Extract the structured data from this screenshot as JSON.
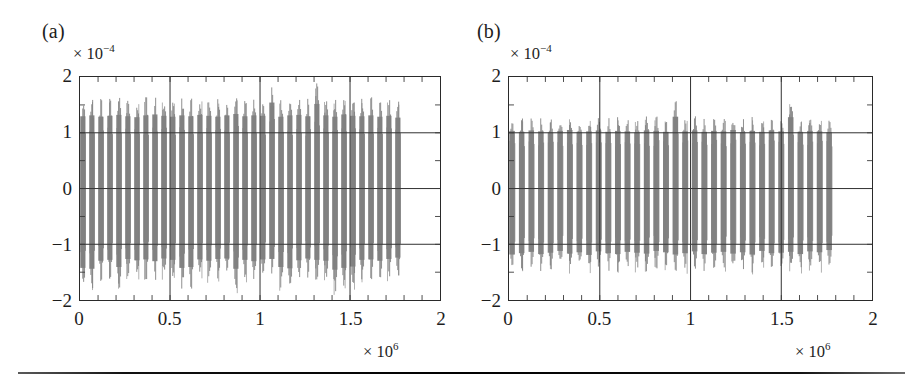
{
  "figure": {
    "background": "#ffffff",
    "trace_color": "#808080",
    "axis_color": "#2a2a2a",
    "has_bottom_rule": true
  },
  "panels": [
    {
      "key": "a",
      "label": "(a)",
      "y_multiplier_prefix": "× 10",
      "y_multiplier_exponent": "−4",
      "x_multiplier_prefix": "× 10",
      "x_multiplier_exponent": "6",
      "y_ticks": [
        "2",
        "1",
        "0",
        "−1",
        "−2"
      ],
      "x_ticks": [
        "0",
        "0.5",
        "1",
        "1.5",
        "2"
      ]
    },
    {
      "key": "b",
      "label": "(b)",
      "y_multiplier_prefix": "× 10",
      "y_multiplier_exponent": "−4",
      "x_multiplier_prefix": "× 10",
      "x_multiplier_exponent": "6",
      "y_ticks": [
        "2",
        "1",
        "0",
        "−1",
        "−2"
      ],
      "x_ticks": [
        "0",
        "0.5",
        "1",
        "1.5",
        "2"
      ]
    }
  ],
  "chart_data": [
    {
      "type": "line",
      "panel": "(a)",
      "title": "",
      "xlabel": "",
      "ylabel": "",
      "xlim": [
        0,
        2000000
      ],
      "ylim": [
        -0.0002,
        0.0002
      ],
      "x_tick_values": [
        0,
        500000,
        1000000,
        1500000,
        2000000
      ],
      "x_tick_labels": [
        "0",
        "0.5",
        "1",
        "1.5",
        "2"
      ],
      "x_multiplier": 1000000,
      "x_multiplier_label": "× 10^6",
      "y_tick_values": [
        -0.0002,
        -0.0001,
        0,
        0.0001,
        0.0002
      ],
      "y_tick_labels": [
        "−2",
        "−1",
        "0",
        "1",
        "2"
      ],
      "y_multiplier": 0.0001,
      "y_multiplier_label": "× 10^-4",
      "grid": true,
      "gridlines_y": [
        -0.0001,
        0,
        0.0001
      ],
      "gridlines_x": [
        500000,
        1000000,
        1500000
      ],
      "minor_tick_spacing_x": 100000,
      "minor_tick_spacing_y": 50000,
      "legend": null,
      "description": "Dense oscillatory burst signal, symmetric about zero, drawn as closely spaced vertical strokes",
      "data_x_start": 0,
      "data_x_end": 1800000,
      "envelope_typical_abs": 0.00016,
      "envelope_peak_abs": 0.00019,
      "burst_count": 36,
      "series": [
        {
          "name": "signal-a",
          "color": "#808080",
          "envelope_upper": [
            1.58,
            1.6,
            1.57,
            1.59,
            1.61,
            1.58,
            1.56,
            1.6,
            1.62,
            1.59,
            1.57,
            1.6,
            1.58,
            1.61,
            1.59,
            1.57,
            1.6,
            1.63,
            1.58,
            1.6,
            1.59,
            1.88,
            1.57,
            1.6,
            1.61,
            1.58,
            1.85,
            1.6,
            1.57,
            1.62,
            1.59,
            1.58,
            1.6,
            1.57,
            1.59,
            1.55
          ],
          "envelope_lower": [
            -1.78,
            -1.8,
            -1.62,
            -1.6,
            -1.76,
            -1.58,
            -1.61,
            -1.59,
            -1.63,
            -1.57,
            -1.6,
            -1.78,
            -1.76,
            -1.59,
            -1.62,
            -1.58,
            -1.57,
            -1.8,
            -1.6,
            -1.63,
            -1.59,
            -1.58,
            -1.76,
            -1.79,
            -1.61,
            -1.57,
            -1.6,
            -1.62,
            -1.82,
            -1.78,
            -1.75,
            -1.6,
            -1.59,
            -1.62,
            -1.58,
            -1.55
          ],
          "units": "×10^-4"
        }
      ]
    },
    {
      "type": "line",
      "panel": "(b)",
      "title": "",
      "xlabel": "",
      "ylabel": "",
      "xlim": [
        0,
        2000000
      ],
      "ylim": [
        -0.0002,
        0.0002
      ],
      "x_tick_values": [
        0,
        500000,
        1000000,
        1500000,
        2000000
      ],
      "x_tick_labels": [
        "0",
        "0.5",
        "1",
        "1.5",
        "2"
      ],
      "x_multiplier": 1000000,
      "x_multiplier_label": "× 10^6",
      "y_tick_values": [
        -0.0002,
        -0.0001,
        0,
        0.0001,
        0.0002
      ],
      "y_tick_labels": [
        "−2",
        "−1",
        "0",
        "1",
        "2"
      ],
      "y_multiplier": 0.0001,
      "y_multiplier_label": "× 10^-4",
      "grid": true,
      "gridlines_y": [
        -0.0001,
        0,
        0.0001
      ],
      "gridlines_x": [
        500000,
        1000000,
        1500000
      ],
      "minor_tick_spacing_x": 100000,
      "minor_tick_spacing_y": 50000,
      "legend": null,
      "description": "Dense oscillatory burst signal with smaller amplitude envelope than panel (a)",
      "data_x_start": 0,
      "data_x_end": 1800000,
      "envelope_typical_abs": 0.000125,
      "envelope_peak_abs": 0.000157,
      "burst_count": 34,
      "series": [
        {
          "name": "signal-b",
          "color": "#808080",
          "envelope_upper": [
            1.26,
            1.24,
            1.27,
            1.25,
            1.23,
            1.26,
            1.28,
            1.24,
            1.25,
            1.27,
            1.24,
            1.26,
            1.25,
            1.23,
            1.27,
            1.26,
            1.24,
            1.57,
            1.25,
            1.27,
            1.24,
            1.26,
            1.25,
            1.28,
            1.23,
            1.26,
            1.24,
            1.27,
            1.25,
            1.56,
            1.24,
            1.26,
            1.25,
            1.23
          ],
          "envelope_lower": [
            -1.48,
            -1.45,
            -1.42,
            -1.47,
            -1.44,
            -1.4,
            -1.46,
            -1.43,
            -1.49,
            -1.41,
            -1.45,
            -1.47,
            -1.42,
            -1.44,
            -1.46,
            -1.4,
            -1.43,
            -1.48,
            -1.45,
            -1.41,
            -1.47,
            -1.44,
            -1.42,
            -1.46,
            -1.43,
            -1.48,
            -1.4,
            -1.45,
            -1.44,
            -1.42,
            -1.47,
            -1.41,
            -1.43,
            -1.38
          ],
          "units": "×10^-4"
        }
      ]
    }
  ]
}
